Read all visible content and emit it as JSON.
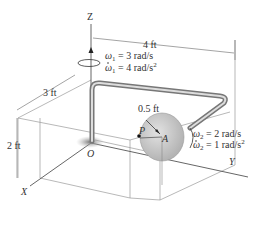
{
  "figure": {
    "axes": {
      "z": "Z",
      "y": "Y",
      "x": "X",
      "origin": "O"
    },
    "points": {
      "p": "P",
      "a": "A"
    },
    "dimensions": {
      "top_length": "4 ft",
      "depth": "3 ft",
      "height": "2 ft",
      "disk_radius": "0.5 ft"
    },
    "rotation_1": {
      "omega": "ω",
      "omega_sub": "1",
      "omega_value": " = 3 rad/s",
      "omega_dot_value": " = 4 rad/s",
      "omega_dot_exp": "2"
    },
    "rotation_2": {
      "omega": "ω",
      "omega_sub": "2",
      "omega_value": " = 2 rad/s",
      "omega_dot_value": " = 1 rad/s",
      "omega_dot_exp": "2"
    },
    "colors": {
      "rod": "#a8a8a8",
      "disk": "#c8c8c8",
      "lines": "#888888",
      "text": "#333333"
    }
  }
}
